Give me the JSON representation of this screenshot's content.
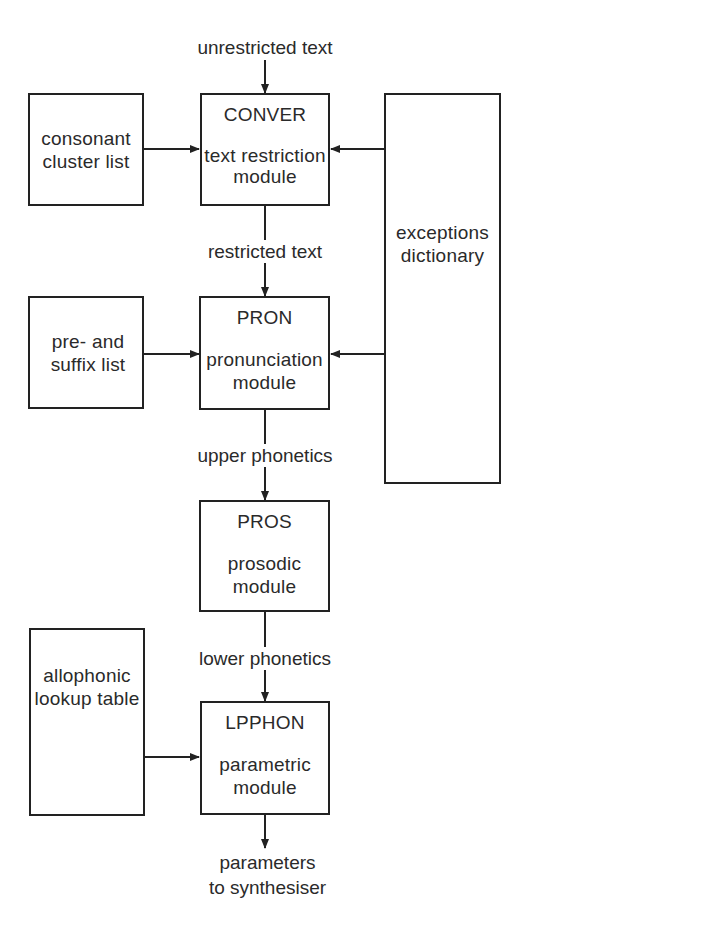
{
  "diagram": {
    "inputs": {
      "top": "unrestricted text"
    },
    "modules": [
      {
        "id": "conver",
        "name": "CONVER",
        "desc": "text restriction\nmodule"
      },
      {
        "id": "pron",
        "name": "PRON",
        "desc": "pronunciation\nmodule"
      },
      {
        "id": "pros",
        "name": "PROS",
        "desc": "prosodic\nmodule"
      },
      {
        "id": "lpphon",
        "name": "LPPHON",
        "desc": "parametric\nmodule"
      }
    ],
    "resources": [
      {
        "id": "consonant",
        "label": "consonant\ncluster list"
      },
      {
        "id": "affix",
        "label": "pre- and\nsuffix list"
      },
      {
        "id": "allophonic",
        "label": "allophonic\nlookup table"
      },
      {
        "id": "exceptions",
        "label": "exceptions\ndictionary"
      }
    ],
    "edges": [
      {
        "label": "restricted text"
      },
      {
        "label": "upper phonetics"
      },
      {
        "label": "lower phonetics"
      },
      {
        "label": "parameters\nto synthesiser"
      }
    ]
  }
}
